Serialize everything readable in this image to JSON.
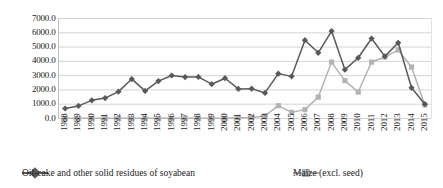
{
  "chart_data": {
    "type": "line",
    "title": "",
    "xlabel": "",
    "ylabel": "",
    "ylim": [
      0,
      7000
    ],
    "ytick_step": 1000,
    "grid": true,
    "legend_position": "bottom",
    "categories": [
      "1988",
      "1989",
      "1990",
      "1991",
      "1992",
      "1993",
      "1994",
      "1995",
      "1996",
      "1997",
      "1998",
      "1999",
      "2000",
      "2001",
      "2002",
      "2003",
      "2004",
      "2005",
      "2006",
      "2007",
      "2008",
      "2009",
      "2010",
      "2011",
      "2012",
      "2013",
      "2014",
      "2015"
    ],
    "ytick_labels": [
      "0.0",
      "1000.0",
      "2000.0",
      "3000.0",
      "4000.0",
      "5000.0",
      "6000.0",
      "7000.0"
    ],
    "ytick_values": [
      0,
      1000,
      2000,
      3000,
      4000,
      5000,
      6000,
      7000
    ],
    "series": [
      {
        "name": "Oil-cake and other solid residues of soyabean",
        "color": "#595959",
        "marker": "diamond",
        "values": [
          700,
          880,
          1270,
          1430,
          1880,
          2760,
          1930,
          2620,
          3010,
          2900,
          2910,
          2400,
          2820,
          2070,
          2090,
          1790,
          3140,
          2950,
          5480,
          4600,
          6120,
          3420,
          4250,
          5600,
          4350,
          5300,
          2150,
          1000
        ]
      },
      {
        "name": "Maize (excl. seed)",
        "color": "#b3b3b3",
        "marker": "square",
        "values": [
          10,
          10,
          10,
          10,
          10,
          10,
          10,
          10,
          10,
          10,
          10,
          10,
          10,
          60,
          70,
          180,
          900,
          430,
          620,
          1500,
          3950,
          2650,
          1850,
          3950,
          4300,
          4800,
          3600,
          950
        ]
      }
    ]
  },
  "legend": {
    "entries": [
      {
        "label": "Oil-cake and other solid residues of soyabean"
      },
      {
        "label": "Maize (excl. seed)"
      }
    ]
  }
}
